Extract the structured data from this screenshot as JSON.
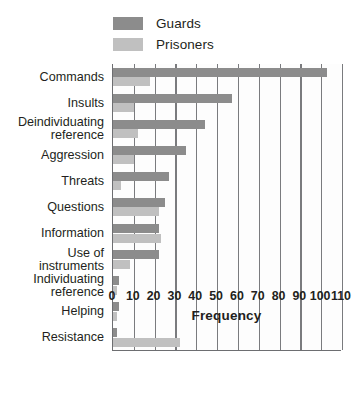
{
  "legend": {
    "position": "top-left",
    "entries": [
      {
        "label": "Guards",
        "color": "#8c8c8c"
      },
      {
        "label": "Prisoners",
        "color": "#c0c0c0"
      }
    ]
  },
  "chart_data": {
    "type": "bar",
    "orientation": "horizontal",
    "title": "",
    "subtitle": "",
    "xlabel": "Frequency",
    "ylabel": "",
    "xlim": [
      0,
      110
    ],
    "xticks": [
      0,
      10,
      20,
      30,
      40,
      50,
      60,
      70,
      80,
      90,
      100,
      110
    ],
    "xticklabels": [
      "0",
      "10",
      "20",
      "30",
      "40",
      "50",
      "60",
      "70",
      "80",
      "90",
      "100",
      "110"
    ],
    "grid": "vertical",
    "legend_position": "top-left",
    "categories": [
      "Commands",
      "Insults",
      "Deindividuating reference",
      "Aggression",
      "Threats",
      "Questions",
      "Information",
      "Use of instruments",
      "Individuating reference",
      "Helping",
      "Resistance"
    ],
    "category_labels": [
      [
        "Commands"
      ],
      [
        "Insults"
      ],
      [
        "Deindividuating",
        "reference"
      ],
      [
        "Aggression"
      ],
      [
        "Threats"
      ],
      [
        "Questions"
      ],
      [
        "Information"
      ],
      [
        "Use of",
        "instruments"
      ],
      [
        "Individuating",
        "reference"
      ],
      [
        "Helping"
      ],
      [
        "Resistance"
      ]
    ],
    "series": [
      {
        "name": "Guards",
        "color": "#8c8c8c",
        "values": [
          103,
          57,
          44,
          35,
          27,
          25,
          22,
          22,
          3,
          3,
          2
        ]
      },
      {
        "name": "Prisoners",
        "color": "#c0c0c0",
        "values": [
          18,
          10,
          12,
          10,
          4,
          22,
          23,
          8,
          2,
          2,
          32
        ]
      }
    ]
  }
}
